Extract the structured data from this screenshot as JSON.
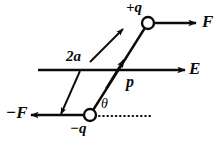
{
  "figure": {
    "name": "electric-dipole-in-uniform-field-diagram",
    "background_color": "#ffffff",
    "ink_color": "#0b0b0b",
    "width": 221,
    "height": 144
  },
  "labels": {
    "force_positive": "F",
    "force_negative": "−F",
    "field": "E",
    "charge_positive": "+q",
    "charge_negative": "−q",
    "dipole_moment": "p",
    "separation": "2a",
    "angle": "θ"
  },
  "geometry": {
    "field_line": {
      "x1": 38,
      "y1": 70,
      "x2": 185,
      "y2": 70
    },
    "dipole_axis": {
      "x1": 90,
      "y1": 115,
      "x2": 148,
      "y2": 23
    },
    "positive_charge": {
      "cx": 148,
      "cy": 23,
      "r": 6
    },
    "negative_charge": {
      "cx": 90,
      "cy": 115,
      "r": 6
    },
    "force_positive_arrow": {
      "x1": 155,
      "y1": 23,
      "x2": 196,
      "y2": 23
    },
    "force_negative_arrow": {
      "x1": 84,
      "y1": 115,
      "x2": 31,
      "y2": 115
    },
    "reference_dotted_line": {
      "x1": 98,
      "y1": 116,
      "x2": 153,
      "y2": 116
    },
    "separation_arrow_upper": {
      "x1": 90,
      "y1": 62,
      "x2": 123,
      "y2": 29
    },
    "separation_arrow_lower": {
      "x1": 80,
      "y1": 71,
      "x2": 61,
      "y2": 114
    }
  }
}
